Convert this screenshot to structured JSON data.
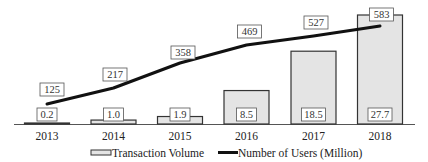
{
  "chart_data": {
    "type": "bar",
    "title": "",
    "xlabel": "",
    "ylabel": "",
    "categories": [
      "2013",
      "2014",
      "2015",
      "2016",
      "2017",
      "2018"
    ],
    "series": [
      {
        "name": "Transaction Volume",
        "type": "bar",
        "values": [
          0.2,
          1.0,
          1.9,
          8.5,
          18.5,
          27.7
        ],
        "labels": [
          "0.2",
          "1.0",
          "1.9",
          "8.5",
          "18.5",
          "27.7"
        ]
      },
      {
        "name": "Number of Users (Million)",
        "type": "line",
        "values": [
          125,
          217,
          358,
          469,
          527,
          583
        ],
        "labels": [
          "125",
          "217",
          "358",
          "469",
          "527",
          "583"
        ]
      }
    ],
    "grid": false,
    "legend_position": "bottom",
    "axes_visible": false
  },
  "legend": {
    "bar_label": "Transaction Volume",
    "line_label": "Number of Users (Million)"
  },
  "colors": {
    "bar_fill": "#e4e4e4",
    "bar_stroke": "#333333",
    "line": "#111111",
    "label_box_stroke": "#555555"
  }
}
